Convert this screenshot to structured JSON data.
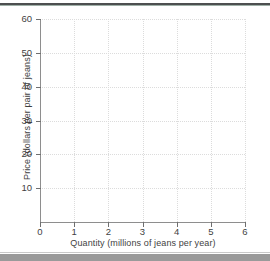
{
  "chart_data": {
    "type": "line",
    "title": "",
    "subtitle": "",
    "xlabel": "Quantity (millions of jeans per year)",
    "ylabel": "Price (dollars per pair of jeans)",
    "xlim": [
      0,
      6
    ],
    "ylim": [
      0,
      60
    ],
    "x_ticks": [
      0,
      1,
      2,
      3,
      4,
      5,
      6
    ],
    "y_ticks": [
      10,
      20,
      30,
      40,
      50,
      60
    ],
    "x_tick_labels": [
      "0",
      "1",
      "2",
      "3",
      "4",
      "5",
      "6"
    ],
    "y_tick_labels": [
      "10",
      "20",
      "30",
      "40",
      "50",
      "60"
    ],
    "grid": true,
    "grid_style": "dotted",
    "legend": false,
    "legend_position": "none",
    "series": [],
    "annotations": [],
    "note": "Blank plotting grid: no data series are drawn in the plot area."
  },
  "style": {
    "axis_color": "#8e8e8e",
    "grid_color": "#dcdcdc",
    "text_color": "#3f3f3f",
    "top_rule_color": "#4d4f50",
    "bottom_band_color": "#9a9a9a",
    "background": "#ffffff"
  },
  "decorations": {
    "top_rule": "page-top-rule",
    "bottom_band": "page-bottom-band"
  }
}
